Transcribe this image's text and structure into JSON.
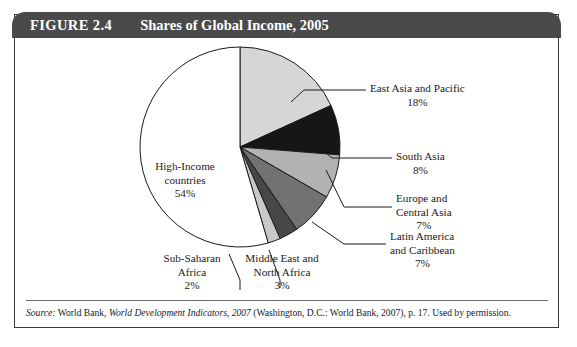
{
  "figure": {
    "number": "FIGURE 2.4",
    "title": "Shares of Global Income, 2005"
  },
  "source": {
    "label": "Source:",
    "publisher": "World Bank,",
    "work_italic": "World Development Indicators, 2007",
    "rest": "(Washington, D.C.: World Bank, 2007), p. 17. Used by permission."
  },
  "chart_data": {
    "type": "pie",
    "title": "Shares of Global Income, 2005",
    "unit": "percent",
    "start_angle_deg": 0,
    "direction": "clockwise",
    "legend": "none-labels-outside",
    "categories": [
      "East Asia and Pacific",
      "South Asia",
      "Europe and Central Asia",
      "Latin America and Caribbean",
      "Middle East and North Africa",
      "Sub-Saharan Africa",
      "High-Income countries"
    ],
    "values": [
      18,
      8,
      7,
      7,
      3,
      2,
      54
    ],
    "colors": [
      "#d6d6d6",
      "#161616",
      "#b2b2b2",
      "#727272",
      "#474747",
      "#c9c9c9",
      "#ffffff"
    ],
    "slices": [
      {
        "name": "East Asia and Pacific",
        "value": 18,
        "label": "18%",
        "color": "#d6d6d6"
      },
      {
        "name": "South Asia",
        "value": 8,
        "label": "8%",
        "color": "#161616"
      },
      {
        "name": "Europe and Central Asia",
        "value": 7,
        "label": "7%",
        "color": "#b2b2b2"
      },
      {
        "name": "Latin America and Caribbean",
        "value": 7,
        "label": "7%",
        "color": "#727272"
      },
      {
        "name": "Middle East and North Africa",
        "value": 3,
        "label": "3%",
        "color": "#474747"
      },
      {
        "name": "Sub-Saharan Africa",
        "value": 2,
        "label": "2%",
        "color": "#c9c9c9"
      },
      {
        "name": "High-Income countries",
        "value": 54,
        "label": "54%",
        "color": "#ffffff"
      }
    ]
  },
  "labels": {
    "east_asia_l1": "East Asia and Pacific",
    "east_asia_l2": "18%",
    "south_asia_l1": "South Asia",
    "south_asia_l2": "8%",
    "europe_l1": "Europe and",
    "europe_l2": "Central Asia",
    "europe_l3": "7%",
    "latin_l1": "Latin America",
    "latin_l2": "and Caribbean",
    "latin_l3": "7%",
    "mena_l1": "Middle East and",
    "mena_l2": "North Africa",
    "mena_l3": "3%",
    "ssa_l1": "Sub-Saharan",
    "ssa_l2": "Africa",
    "ssa_l3": "2%",
    "high_income_l1": "High-Income",
    "high_income_l2": "countries",
    "high_income_l3": "54%"
  }
}
